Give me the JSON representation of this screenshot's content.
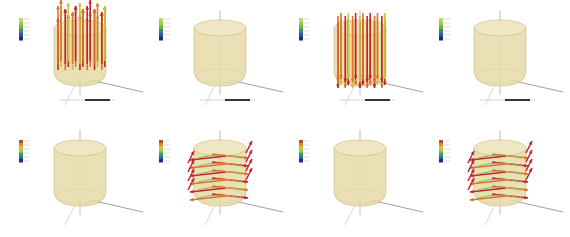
{
  "figure": {
    "layout": {
      "rows": 2,
      "cols": 4
    },
    "colors": {
      "background": "#ffffff",
      "cylinder_fill": "#e8d9a8",
      "cylinder_stroke": "#c9b57a",
      "arrow_red": "#c0282a",
      "arrow_orange": "#d9752a",
      "arrow_yellow": "#c9c23a",
      "arrow_green": "#8fb84a",
      "axis": "#777777",
      "legend_top": [
        "#b7d86a",
        "#9cc64a",
        "#6fae3a",
        "#3f8a6a",
        "#2a5aa0",
        "#1a2a7a"
      ],
      "legend_bottom": [
        "#b0502a",
        "#d98a2a",
        "#e0c030",
        "#9cc640",
        "#40a050",
        "#2a70b0",
        "#1a2a80"
      ]
    },
    "panels": [
      {
        "row": 0,
        "col": 0,
        "field": "vertical-up",
        "arrows": true,
        "legend": "top"
      },
      {
        "row": 0,
        "col": 1,
        "field": "none",
        "arrows": false,
        "legend": "top"
      },
      {
        "row": 0,
        "col": 2,
        "field": "vertical-down",
        "arrows": true,
        "legend": "top"
      },
      {
        "row": 0,
        "col": 3,
        "field": "none",
        "arrows": false,
        "legend": "top"
      },
      {
        "row": 1,
        "col": 0,
        "field": "none",
        "arrows": false,
        "legend": "bottom"
      },
      {
        "row": 1,
        "col": 1,
        "field": "horizontal-swirl",
        "arrows": true,
        "legend": "bottom"
      },
      {
        "row": 1,
        "col": 2,
        "field": "none",
        "arrows": false,
        "legend": "bottom"
      },
      {
        "row": 1,
        "col": 3,
        "field": "horizontal-swirl",
        "arrows": true,
        "legend": "bottom"
      }
    ]
  }
}
